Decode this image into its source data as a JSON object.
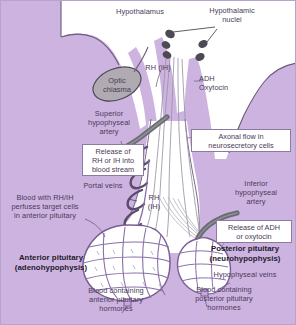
{
  "figure": {
    "background_color": "#cdb4e0",
    "brain_fill": "#ffffff",
    "chiasma_fill": "#b0aab2",
    "artery_color": "#6b6b72",
    "vessel_color": "#8a6fa8",
    "text_color": "#4b3a58",
    "box_fill": "#ffffff"
  },
  "labels": {
    "hypothalamus": "Hypothalamus",
    "hypothalamic_nuclei": "Hypothalamic\nnuclei",
    "rh_ih_top": "RH (IH)",
    "adh_oxytocin": "ADH\nOxytocin",
    "optic_chiasma": "Optic\nchiasma",
    "superior_hypophyseal_artery": "Superior\nhypophyseal\nartery",
    "portal_veins": "Portal veins",
    "rh_ih_stalk": "RH\n(IH)",
    "inferior_hypophyseal_artery": "Inferior\nhypophyseal\nartery",
    "blood_with_rh_ih": "Blood with RH/IH\nperfuses target cells\nin anterior pituitary",
    "anterior_pituitary": "Anterior pituitary\n(adenohypophysis)",
    "posterior_pituitary": "Posterior pituitary\n(neurohypophysis)",
    "hypophyseal_veins": "Hypophyseal veins",
    "blood_anterior_hormones": "Blood containing\nanterior pituitary\nhormones",
    "blood_posterior_hormones": "Blood containing\nposterior pituitary\nhormones"
  },
  "callout_boxes": {
    "release_rh_ih": "Release of\nRH or IH into\nblood stream",
    "axonal_flow": "Axonal flow in\nneurosecretory cells",
    "release_adh": "Release of ADH\nor oxytocin"
  }
}
